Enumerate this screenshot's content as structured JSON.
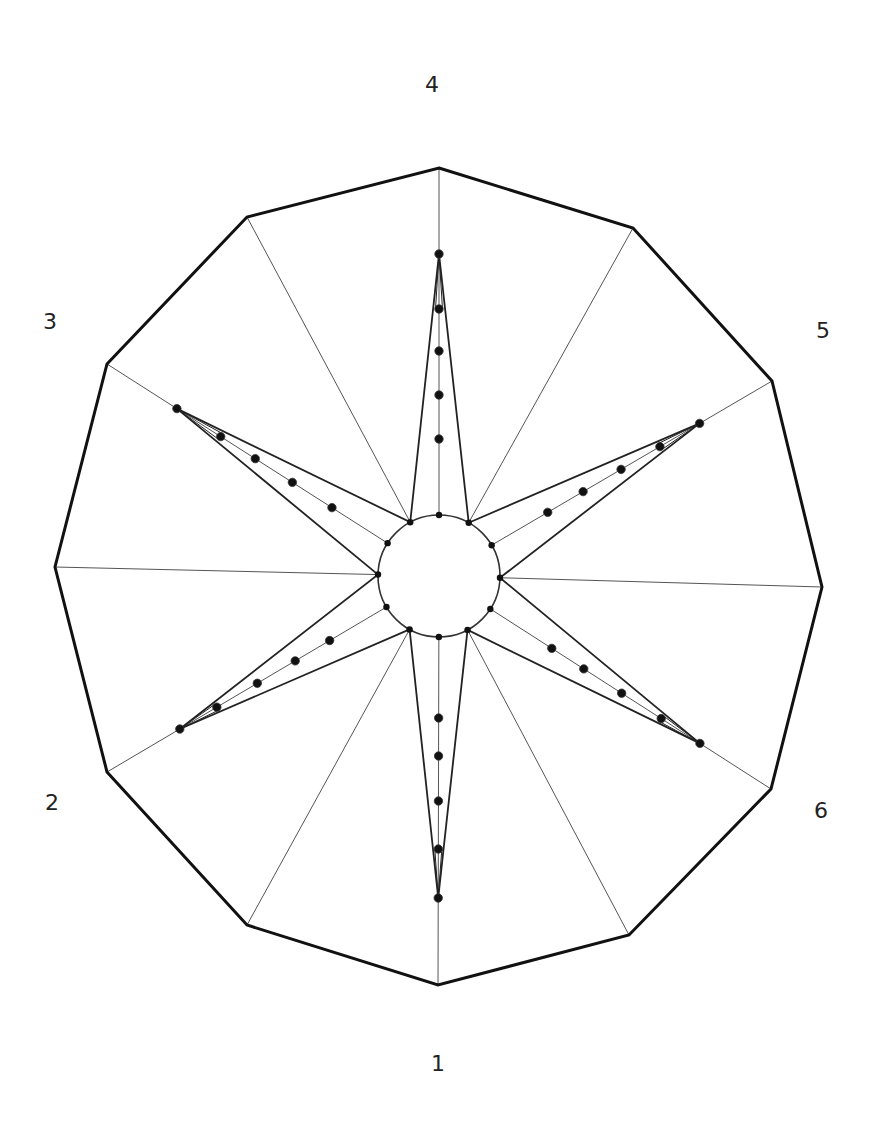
{
  "diagram": {
    "type": "radial-star-diagram",
    "center": [
      439,
      576
    ],
    "inner_circle_radius": 61,
    "colors": {
      "outline": "#111111",
      "spoke": "#555555",
      "spike": "#222222",
      "dot": "#111111",
      "background": "#ffffff"
    },
    "outer_polygon": [
      [
        439,
        168
      ],
      [
        633,
        228
      ],
      [
        772,
        381
      ],
      [
        822,
        587
      ],
      [
        771,
        789
      ],
      [
        629,
        935
      ],
      [
        438,
        985
      ],
      [
        247,
        925
      ],
      [
        107,
        772
      ],
      [
        55,
        567
      ],
      [
        107,
        364
      ],
      [
        247,
        217
      ]
    ],
    "labels": [
      {
        "text": "4",
        "x": 432,
        "y": 85
      },
      {
        "text": "5",
        "x": 823,
        "y": 331
      },
      {
        "text": "6",
        "x": 821,
        "y": 811
      },
      {
        "text": "1",
        "x": 438,
        "y": 1064
      },
      {
        "text": "2",
        "x": 52,
        "y": 803
      },
      {
        "text": "3",
        "x": 50,
        "y": 322
      }
    ],
    "spikes": [
      {
        "axis": "4",
        "vertex_index": 0,
        "dot_distances": [
          322,
          267,
          225,
          181,
          137
        ]
      },
      {
        "axis": "5",
        "vertex_index": 2,
        "dot_distances": [
          302,
          256,
          211,
          167,
          126
        ]
      },
      {
        "axis": "6",
        "vertex_index": 4,
        "dot_distances": [
          310,
          264,
          217,
          172,
          134
        ]
      },
      {
        "axis": "1",
        "vertex_index": 6,
        "dot_distances": [
          322,
          273,
          225,
          180,
          142
        ]
      },
      {
        "axis": "2",
        "vertex_index": 8,
        "dot_distances": [
          301,
          258,
          211,
          167,
          127
        ]
      },
      {
        "axis": "3",
        "vertex_index": 10,
        "dot_distances": [
          311,
          259,
          218,
          174,
          127
        ]
      }
    ]
  },
  "chart_data": {
    "type": "radar",
    "title": "",
    "categories": [
      "1",
      "2",
      "3",
      "4",
      "5",
      "6"
    ],
    "series": [
      {
        "name": "level-1",
        "values": [
          142,
          127,
          127,
          137,
          126,
          134
        ]
      },
      {
        "name": "level-2",
        "values": [
          180,
          167,
          174,
          181,
          167,
          172
        ]
      },
      {
        "name": "level-3",
        "values": [
          225,
          211,
          218,
          225,
          211,
          217
        ]
      },
      {
        "name": "level-4",
        "values": [
          273,
          258,
          259,
          267,
          256,
          264
        ]
      },
      {
        "name": "level-5",
        "values": [
          322,
          301,
          311,
          322,
          302,
          310
        ]
      }
    ],
    "units": "pixel distance from center",
    "inner_circle_radius": 61,
    "outer_radius_approx": 400
  }
}
